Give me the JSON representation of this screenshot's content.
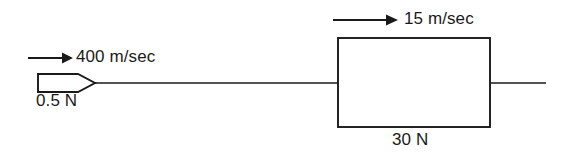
{
  "diagram": {
    "background_color": "#ffffff",
    "ink_color": "#1a1a1a",
    "width": 565,
    "height": 159
  },
  "bullet": {
    "force_label": "0.5 N",
    "velocity_label": "400 m/sec",
    "velocity_value": 400,
    "velocity_unit": "m/sec",
    "weight_value": 0.5,
    "weight_unit": "N",
    "direction": "right",
    "shape": "pointed-bullet-outline"
  },
  "block": {
    "force_label": "30 N",
    "velocity_label": "15 m/sec",
    "velocity_value": 15,
    "velocity_unit": "m/sec",
    "weight_value": 30,
    "weight_unit": "N",
    "direction": "right",
    "shape": "rectangle-outline"
  },
  "axis": {
    "name": "horizontal-motion-line"
  },
  "icons": {
    "bullet_velocity_arrow": "arrow-right-icon",
    "block_velocity_arrow": "arrow-right-icon"
  }
}
